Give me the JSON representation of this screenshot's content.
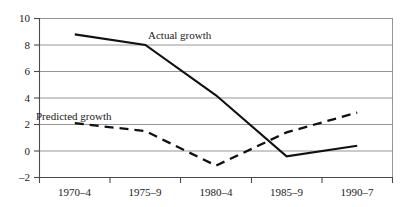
{
  "chart_data": {
    "type": "line",
    "title": "",
    "subtitle": "",
    "xlabel": "",
    "ylabel": "",
    "categories": [
      "1970–4",
      "1975–9",
      "1980–4",
      "1985–9",
      "1990–7"
    ],
    "x": [
      0,
      1,
      2,
      3,
      4
    ],
    "series": [
      {
        "name": "Actual growth",
        "style": "solid",
        "values": [
          8.8,
          8.0,
          4.2,
          -0.4,
          0.4
        ]
      },
      {
        "name": "Predicted growth",
        "style": "dashed",
        "values": [
          2.1,
          1.5,
          -1.1,
          1.4,
          2.9
        ]
      }
    ],
    "ylim": [
      -2,
      10
    ],
    "xlim": [
      -0.5,
      4.5
    ],
    "yticks": [
      -2,
      0,
      2,
      4,
      6,
      8,
      10
    ],
    "ytick_labels": [
      "–2",
      "0",
      "2",
      "4",
      "6",
      "8",
      "10"
    ],
    "grid": true,
    "grid_axis": "y",
    "legend": "inline-annotations",
    "annotations": [
      {
        "text": "Actual growth",
        "series": "Actual growth",
        "x_px": 148,
        "y_px": 36
      },
      {
        "text": "Predicted growth",
        "series": "Predicted growth",
        "x_px": 36,
        "y_px": 117
      }
    ]
  },
  "axes": {
    "y_tick_labels": [
      "10",
      "8",
      "6",
      "4",
      "2",
      "0",
      "–2"
    ],
    "x_tick_labels": [
      "1970–4",
      "1975–9",
      "1980–4",
      "1985–9",
      "1990–7"
    ]
  },
  "colors": {
    "line": "#111111",
    "grid": "#8a8a8a",
    "axis": "#4a4a4a",
    "background": "#ffffff",
    "text": "#1a1a1a"
  }
}
